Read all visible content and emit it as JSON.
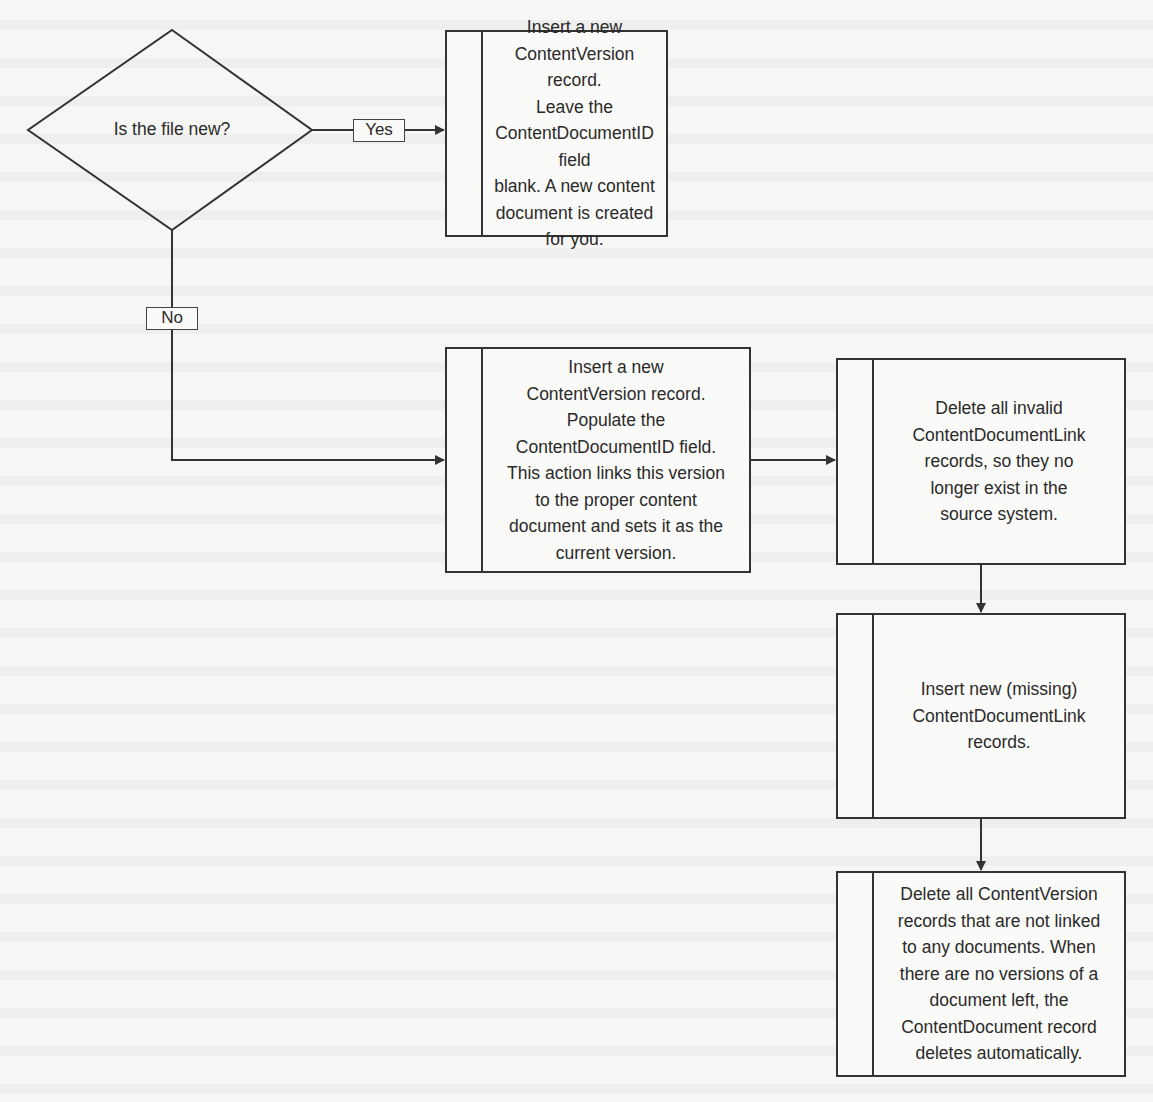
{
  "diagram": {
    "decision": {
      "question": "Is the file new?"
    },
    "branches": {
      "yes_label": "Yes",
      "no_label": "No"
    },
    "steps": [
      {
        "id": "insert-new-version-new-doc",
        "text": "Insert a new\nContentVersion record.\nLeave the\nContentDocumentID field\nblank. A new content\ndocument is created\nfor you."
      },
      {
        "id": "insert-new-version-existing-doc",
        "text": "Insert a new\nContentVersion record.\nPopulate the\nContentDocumentID field.\nThis action links this version\nto the proper content\ndocument and sets it as the\ncurrent version."
      },
      {
        "id": "delete-invalid-links",
        "text": "Delete all invalid\nContentDocumentLink\nrecords, so they no\nlonger exist in the\nsource system."
      },
      {
        "id": "insert-missing-links",
        "text": "Insert new (missing)\nContentDocumentLink\nrecords."
      },
      {
        "id": "delete-unlinked-versions",
        "text": "Delete all ContentVersion\nrecords that are not linked\nto any documents. When\nthere are no versions of a\ndocument left, the\nContentDocument record\ndeletes automatically."
      }
    ],
    "colors": {
      "stroke": "#333333",
      "background": "#f6f6f4"
    }
  }
}
